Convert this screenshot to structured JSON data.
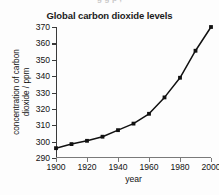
{
  "page": {
    "top_remnant_text": "g g   p                   ,",
    "background_color": "#fdfdfd"
  },
  "chart_data": {
    "type": "line",
    "title": "Global carbon dioxide levels",
    "xlabel": "year",
    "ylabel_line1": "concentration of carbon",
    "ylabel_line2": "dioxide / ppm",
    "x": [
      1900,
      1910,
      1920,
      1930,
      1940,
      1950,
      1960,
      1970,
      1980,
      1990,
      2000
    ],
    "values": [
      296,
      298.5,
      300.5,
      303,
      307,
      311,
      317,
      327,
      339,
      355.5,
      370
    ],
    "xlim": [
      1900,
      2000
    ],
    "ylim": [
      290,
      370
    ],
    "xticks": [
      1900,
      1920,
      1940,
      1960,
      1980,
      2000
    ],
    "xtick_labels": [
      "1900",
      "1920",
      "1940",
      "1960",
      "1980",
      "2000"
    ],
    "yticks": [
      290,
      300,
      310,
      320,
      330,
      340,
      350,
      360,
      370
    ],
    "ytick_labels": [
      "290",
      "300",
      "310",
      "320",
      "330",
      "340",
      "350",
      "360",
      "370"
    ],
    "grid": false,
    "legend": null,
    "marker": "square",
    "line_color": "#111111",
    "marker_color": "#111111",
    "axis_color": "#3a3a3a"
  }
}
